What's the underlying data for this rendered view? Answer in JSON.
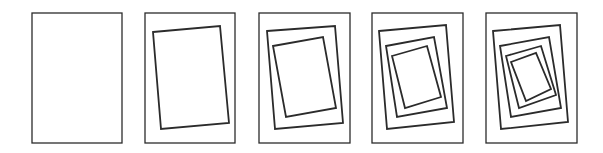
{
  "diagram": {
    "stroke_color": "#2b2b2b",
    "background": "#ffffff",
    "panels": [
      {
        "id": "panel-1",
        "frame": [
          32,
          13,
          90,
          130
        ],
        "nested": []
      },
      {
        "id": "panel-2",
        "frame": [
          145,
          13,
          90,
          130
        ],
        "nested": [
          "153,32 220,26 229,123 161,129"
        ]
      },
      {
        "id": "panel-3",
        "frame": [
          259,
          13,
          91,
          130
        ],
        "nested": [
          "267,31 335,26 343,123 275,129",
          "273,46 323,37 336,108 286,117"
        ]
      },
      {
        "id": "panel-4",
        "frame": [
          372,
          13,
          91,
          130
        ],
        "nested": [
          "379,31 446,25 454,122 387,129",
          "386,46 434,37 447,108 397,117",
          "392,56 427,46 441,97 405,108"
        ]
      },
      {
        "id": "panel-5",
        "frame": [
          486,
          13,
          91,
          130
        ],
        "nested": [
          "493,31 560,25 568,122 501,129",
          "500,46 549,37 561,108 511,117",
          "506,56 541,46 556,95 519,108",
          "511,62 536,53 551,89 526,101"
        ]
      }
    ]
  }
}
